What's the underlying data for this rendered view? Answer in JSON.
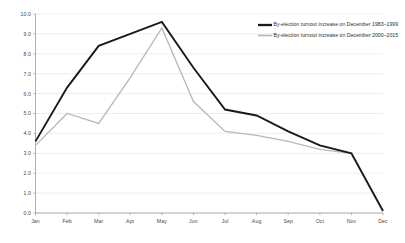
{
  "chart_data": {
    "type": "line",
    "title": "",
    "xlabel": "",
    "ylabel": "",
    "categories": [
      "Jan",
      "Feb",
      "Mar",
      "Apr",
      "May",
      "Jun",
      "Jul",
      "Aug",
      "Sep",
      "Oct",
      "Nov",
      "Dec"
    ],
    "ylim": [
      0.0,
      10.0
    ],
    "yticks": [
      "0.0",
      "1.0",
      "2.0",
      "3.0",
      "4.0",
      "5.0",
      "6.0",
      "7.0",
      "8.0",
      "9.0",
      "10.0"
    ],
    "ytick_values": [
      0.0,
      1.0,
      2.0,
      3.0,
      4.0,
      5.0,
      6.0,
      7.0,
      8.0,
      9.0,
      10.0
    ],
    "grid": true,
    "legend_position": "top-right",
    "series": [
      {
        "name": "By-election turnout increase on December 1983–1999",
        "color": "#1a1a1a",
        "width": 1.9,
        "values": [
          3.6,
          6.3,
          8.4,
          9.0,
          9.6,
          7.3,
          5.2,
          4.9,
          4.1,
          3.4,
          3.0,
          0.1
        ]
      },
      {
        "name": "By-election turnout increase on December 2000–2015",
        "color": "#b8b8b8",
        "width": 1.3,
        "values": [
          3.4,
          5.0,
          4.5,
          6.8,
          9.3,
          5.6,
          4.1,
          3.9,
          3.6,
          3.2,
          3.0,
          0.1
        ]
      }
    ]
  },
  "legend": {
    "items": [
      {
        "label": "By-election turnout increase on December 1983–1999"
      },
      {
        "label": "By-election turnout increase on December 2000–2015"
      }
    ]
  }
}
